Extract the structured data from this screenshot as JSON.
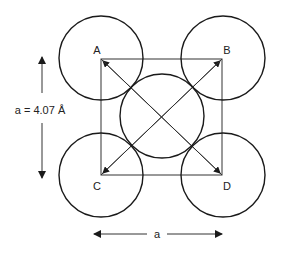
{
  "diagram": {
    "corners": [
      {
        "label": "A",
        "x": 101,
        "y": 59
      },
      {
        "label": "B",
        "x": 222,
        "y": 59
      },
      {
        "label": "C",
        "x": 101,
        "y": 175
      },
      {
        "label": "D",
        "x": 222,
        "y": 175
      }
    ],
    "atoms": [
      {
        "name": "atom-A",
        "cx": 101,
        "cy": 58,
        "r": 42
      },
      {
        "name": "atom-B",
        "cx": 223,
        "cy": 58,
        "r": 42
      },
      {
        "name": "atom-center",
        "cx": 162,
        "cy": 116,
        "r": 42
      },
      {
        "name": "atom-C",
        "cx": 101,
        "cy": 175,
        "r": 42
      },
      {
        "name": "atom-D",
        "cx": 223,
        "cy": 175,
        "r": 42
      }
    ],
    "vertical_dimension_label": "a = 4.07 Å",
    "horizontal_dimension_label": "a",
    "colors": {
      "stroke": "#1a1a1a",
      "thin_line": "#333333",
      "background": "#ffffff"
    }
  }
}
